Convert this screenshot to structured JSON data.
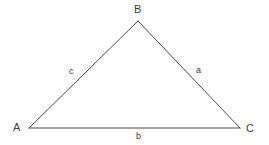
{
  "figure": {
    "kind": "triangle-diagram",
    "width": 269,
    "height": 145,
    "background_color": "#ffffff",
    "stroke_color": "#4a4a4a",
    "stroke_width": 1,
    "text_color": "#3b3b3b"
  },
  "vertices": [
    {
      "id": "A",
      "label": "A",
      "x": 29,
      "y": 128
    },
    {
      "id": "B",
      "label": "B",
      "x": 138,
      "y": 21
    },
    {
      "id": "C",
      "label": "C",
      "x": 240,
      "y": 128
    }
  ],
  "sides": [
    {
      "id": "c",
      "label": "c",
      "from": "A",
      "to": "B",
      "x1": 29,
      "y1": 128,
      "x2": 138,
      "y2": 21
    },
    {
      "id": "a",
      "label": "a",
      "from": "B",
      "to": "C",
      "x1": 138,
      "y1": 21,
      "x2": 240,
      "y2": 128
    },
    {
      "id": "b",
      "label": "b",
      "from": "A",
      "to": "C",
      "x1": 29,
      "y1": 128,
      "x2": 240,
      "y2": 128
    }
  ]
}
